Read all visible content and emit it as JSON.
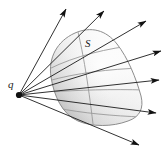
{
  "figure": {
    "type": "geometry-diagram",
    "background_color": "#ffffff",
    "labels": [
      {
        "id": "q",
        "text": "q",
        "role": "point-source-label",
        "x": 8,
        "y": 79
      },
      {
        "id": "S",
        "text": "S",
        "role": "surface-label",
        "x": 85,
        "y": 38
      }
    ],
    "source_point": {
      "name": "q",
      "x": 19,
      "y": 95,
      "dot_color": "#111111",
      "dot_radius": 3.1
    },
    "surface": {
      "name": "S",
      "outline_color": "#8a8a8a",
      "fill_light": "#fdfdfd",
      "fill_mid": "#e8e8e8",
      "fill_dark": "#c9c9c9",
      "outline_width": 1.0
    },
    "rays": {
      "color": "#1a1a1a",
      "width": 0.9,
      "count": 8,
      "arrow_color": "#111111",
      "endpoints": [
        {
          "id": "ray-1",
          "x": 66,
          "y": 9,
          "label": "upper-left-ray"
        },
        {
          "id": "ray-2",
          "x": 104,
          "y": 11,
          "label": "upper-mid-ray"
        },
        {
          "id": "ray-3",
          "x": 146,
          "y": 21,
          "label": "upper-right-ray"
        },
        {
          "id": "ray-4",
          "x": 161,
          "y": 51,
          "label": "right-upper-ray"
        },
        {
          "id": "ray-5",
          "x": 159,
          "y": 80,
          "label": "right-horizontal-ray"
        },
        {
          "id": "ray-6",
          "x": 156,
          "y": 113,
          "label": "right-lower-ray"
        },
        {
          "id": "ray-7",
          "x": 139,
          "y": 145,
          "label": "lower-right-ray"
        }
      ]
    },
    "cross_lines": {
      "color": "#9a9a9a",
      "width": 0.9,
      "count": 4,
      "description": "Faint chord lines across the surface marking ray intersections"
    }
  }
}
